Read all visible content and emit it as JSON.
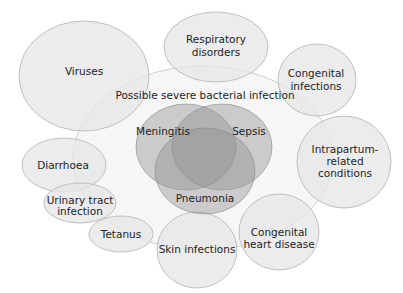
{
  "title": "Possible severe bacterial infection",
  "colors": {
    "outer_fill": "#e9e9e9",
    "outer_stroke": "#b5b5b5",
    "psbi_fill": "#f3f3f3",
    "core_fill": "#8d8d8d",
    "text": "#1e1e1e"
  },
  "core_conditions": {
    "meningitis": "Meningitis",
    "sepsis": "Sepsis",
    "pneumonia": "Pneumonia"
  },
  "surrounding_conditions": {
    "viruses": [
      "Viruses"
    ],
    "respiratory": [
      "Respiratory",
      "disorders"
    ],
    "congenital_infections": [
      "Congenital",
      "infections"
    ],
    "intrapartum": [
      "Intrapartum-",
      "related",
      "conditions"
    ],
    "diarrhoea": [
      "Diarrhoea"
    ],
    "urinary": [
      "Urinary tract",
      "infection"
    ],
    "tetanus": [
      "Tetanus"
    ],
    "skin": [
      "Skin infections"
    ],
    "heart": [
      "Congenital",
      "heart disease"
    ]
  }
}
